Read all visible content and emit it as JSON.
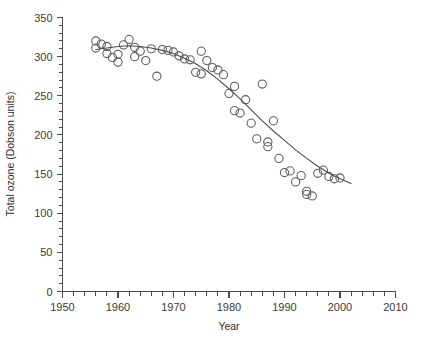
{
  "chart_data": {
    "type": "scatter",
    "title": "",
    "xlabel": "Year",
    "ylabel": "Total ozone (Dobson units)",
    "xlim": [
      1950,
      2010
    ],
    "ylim": [
      0,
      350
    ],
    "x_major_ticks": [
      1950,
      1960,
      1970,
      1980,
      1990,
      2000,
      2010
    ],
    "x_major_tick_labels": [
      "1950",
      "1960",
      "1970",
      "1980",
      "1990",
      "2000",
      "2010"
    ],
    "x_minor_tick_step": 2,
    "y_major_ticks": [
      0,
      50,
      100,
      150,
      200,
      250,
      300,
      350
    ],
    "y_major_tick_labels": [
      "0",
      "50",
      "100",
      "150",
      "200",
      "250",
      "300",
      "350"
    ],
    "y_minor_tick_step": 10,
    "grid": false,
    "legend": null,
    "marker": "open-circle",
    "marker_color": "#5a5a5a",
    "axis_color": "#4d4d4d",
    "trend_color": "#4a4a4a",
    "series": [
      {
        "name": "Total ozone",
        "x": [
          1956,
          1956,
          1957,
          1958,
          1958,
          1959,
          1960,
          1960,
          1961,
          1962,
          1963,
          1963,
          1964,
          1965,
          1966,
          1967,
          1968,
          1969,
          1970,
          1971,
          1972,
          1973,
          1974,
          1975,
          1975,
          1976,
          1977,
          1978,
          1979,
          1980,
          1981,
          1981,
          1982,
          1983,
          1984,
          1985,
          1986,
          1987,
          1987,
          1988,
          1989,
          1990,
          1991,
          1992,
          1993,
          1994,
          1994,
          1995,
          1996,
          1997,
          1998,
          1999,
          2000
        ],
        "y": [
          320,
          311,
          316,
          313,
          304,
          299,
          303,
          293,
          315,
          322,
          312,
          300,
          307,
          295,
          310,
          275,
          309,
          308,
          306,
          301,
          297,
          296,
          280,
          307,
          278,
          295,
          286,
          283,
          277,
          253,
          262,
          231,
          228,
          245,
          215,
          195,
          265,
          191,
          185,
          218,
          170,
          152,
          154,
          140,
          148,
          128,
          124,
          122,
          151,
          155,
          147,
          144,
          145
        ]
      }
    ],
    "trend": {
      "name": "fitted-trend",
      "x": [
        1956,
        1958,
        1960,
        1962,
        1964,
        1966,
        1968,
        1970,
        1972,
        1974,
        1976,
        1978,
        1980,
        1982,
        1984,
        1986,
        1988,
        1990,
        1992,
        1994,
        1996,
        1998,
        2000,
        2002
      ],
      "y": [
        309,
        311,
        313,
        314,
        313,
        311,
        308,
        304,
        298,
        291,
        282,
        271,
        259,
        246,
        232,
        218,
        205,
        193,
        181,
        170,
        160,
        151,
        144,
        138
      ]
    }
  }
}
